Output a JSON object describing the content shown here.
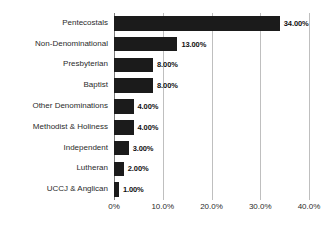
{
  "chart_data": {
    "type": "bar",
    "orientation": "horizontal",
    "title": "",
    "subtitle": "",
    "xlabel": "",
    "ylabel": "",
    "categories": [
      "Pentecostals",
      "Non-Denominational",
      "Presbyterian",
      "Baptist",
      "Other Denominations",
      "Methodist & Holiness",
      "Independent",
      "Lutheran",
      "UCCJ & Anglican"
    ],
    "values": [
      34.0,
      13.0,
      8.0,
      8.0,
      4.0,
      4.0,
      3.0,
      2.0,
      1.0
    ],
    "data_labels": [
      "34.00%",
      "13.00%",
      "8.00%",
      "8.00%",
      "4.00%",
      "4.00%",
      "3.00%",
      "2.00%",
      "1.00%"
    ],
    "xlim": [
      0,
      40
    ],
    "xticks": [
      0,
      10,
      20,
      30,
      40
    ],
    "xtick_labels": [
      "0%",
      "10.0%",
      "20.0%",
      "30.0%",
      "40.0%"
    ],
    "grid": true,
    "grid_axis": "x",
    "legend": false,
    "bar_color": "#1b1b1b",
    "gridline_color": "#bfbfbf",
    "axis_color": "#7a7a7a",
    "background_color": "#ffffff",
    "text_color": "#2b2b2b"
  }
}
